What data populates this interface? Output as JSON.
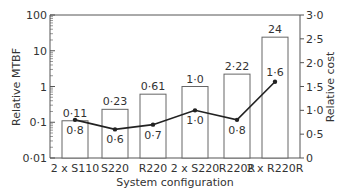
{
  "chart_data": {
    "type": "bar",
    "title": "",
    "xlabel": "System configuration",
    "ylabel": "Relative MTBF",
    "y2label": "Relative cost",
    "categories": [
      "2 x S110",
      "S220",
      "R220",
      "2 x S220",
      "R220R",
      "2 x R220R"
    ],
    "series": [
      {
        "name": "Relative MTBF",
        "chart": "bar",
        "axis": "left",
        "scale": "log",
        "values": [
          0.11,
          0.23,
          0.61,
          1.0,
          2.22,
          24
        ],
        "labels": [
          "0·11",
          "0·23",
          "0·61",
          "1·0",
          "2·22",
          "24"
        ]
      },
      {
        "name": "Relative cost",
        "chart": "line",
        "axis": "right",
        "values": [
          0.8,
          0.6,
          0.7,
          1.0,
          0.8,
          1.6
        ],
        "labels": [
          "0·8",
          "0·6",
          "0·7",
          "1·0",
          "0·8",
          "1·6"
        ]
      }
    ],
    "ylim": [
      0.01,
      100
    ],
    "y2lim": [
      0,
      3.0
    ],
    "yticks": [
      "0·01",
      "0·1",
      "1",
      "10",
      "100"
    ],
    "y2ticks": [
      "0",
      "0·5",
      "1·0",
      "1·5",
      "2·0",
      "2·5",
      "3·0"
    ],
    "grid": false,
    "legend": "none"
  }
}
